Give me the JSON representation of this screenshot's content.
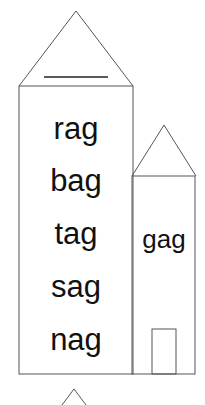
{
  "tall_house": {
    "title_blank": "",
    "words": [
      "rag",
      "bag",
      "tag",
      "sag",
      "nag"
    ]
  },
  "small_house": {
    "word": "gag"
  },
  "colors": {
    "line": "#555555",
    "title_line": "#222222",
    "text": "#111111",
    "background": "#ffffff"
  }
}
